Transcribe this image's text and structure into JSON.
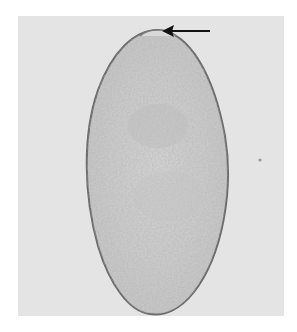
{
  "figure": {
    "background_color": "#e4e4e4",
    "egg_fill_color": "#cfcfcf",
    "egg_outline_color": "#6a6a6a",
    "arrow_color": "#111111",
    "annotation": {
      "type": "arrow",
      "points_to": "operculum",
      "direction": "left"
    }
  }
}
